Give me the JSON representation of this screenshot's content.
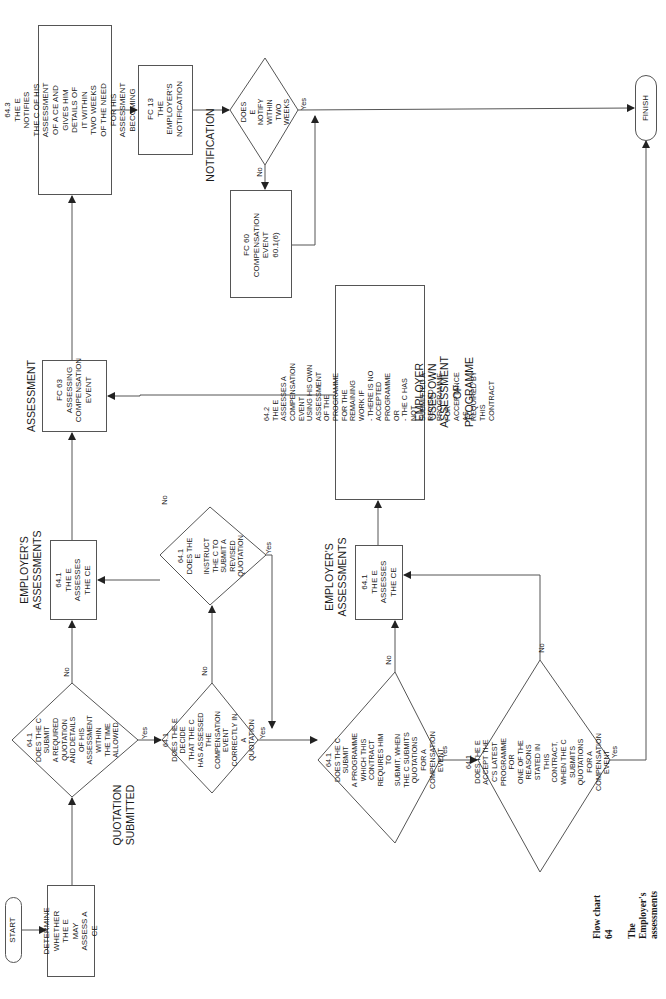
{
  "orientation": "page rotated 90 degrees counter-clockwise",
  "caption": {
    "line1": "Flow chart 64",
    "line2": "The Employer's assessments"
  },
  "terminals": {
    "start": "START",
    "finish": "FINISH"
  },
  "section_labels": {
    "quotation_submitted": "QUOTATION\nSUBMITTED",
    "employers_assessments_top": "EMPLOYER'S\nASSESSMENTS",
    "employers_assessments_bottom": "EMPLOYER'S\nASSESSMENTS",
    "assessment": "ASSESSMENT",
    "notification": "NOTIFICATION",
    "employer_uses_own": "EMPLOYER USES OWN\nASSESSMENT OF PROGRAMME"
  },
  "process_boxes": {
    "determine": "DETERMINE\nWHETHER THE E\nMAY ASSESS A CE",
    "assess_ce_top": "64.1\nTHE E ASSESSES\nTHE CE",
    "assess_ce_bottom": "64.1\nTHE E ASSESSES\nTHE CE",
    "notify_64_3": "64.3\nTHE E NOTIFIES THE C OF HIS\nASSESSMENT OF A CE AND GIVES HIM\nDETAILS OF IT WITHIN TWO WEEKS\nOF THE NEED FOR HIS ASSESSMENT\nBECOMING APPARENT",
    "own_assessment_64_2": "64.2\nTHE E ASSESSES A COMPENSATION EVENT\nUSING HIS OWN ASSESSMENT OF THE\nPROGRAMME FOR THE REMAINING WORK IF\n- THERE IS NO ACCEPTED PROGRAMME OR\n- THE C HAS NOT SUBMITTED A REVISED\n  PROGRAMME FOR ACCEPTANCE AS\n  REQUIRED BY THIS CONTRACT"
  },
  "subprocess_boxes": {
    "fc63": "FC 63\nASSESSING\nCOMPENSATION\nEVENT",
    "fc13": "FC 13\nTHE\nEMPLOYER'S\nNOTIFICATION",
    "fc60": "FC 60\nCOMPENSATION\nEVENT\n60.1(6)"
  },
  "decisions": {
    "submit_quotation": "64.1\nDOES THE C SUBMIT\nA REQUIRED QUOTATION\nAND DETAILS OF HIS\nASSESSMENT WITHIN\nTHE TIME ALLOWED",
    "assessed_correctly": "64.1\nDOES THE E DECIDE\nTHAT THE C HAS ASSESSED\nTHE COMPENSATION EVENT\nCORRECTLY IN A\nQUOTATION",
    "instruct_revised": "64.1\nDOES THE E\nINSTRUCT THE C TO\nSUBMIT A REVISED\nQUOTATION",
    "notify_two_weeks": "DOES\nE NOTIFY WITHIN\nTWO WEEKS",
    "submit_programme": "64.1\nDOES THE C SUBMIT\nA PROGRAMME WHICH THIS\nCONTRACT REQUIRES HIM TO\nSUBMIT, WHEN THE C SUBMITS\nQUOTATIONS FOR A\nCOMPENSATION\nEVENT",
    "accept_programme": "64.1\nDOES THE E ACCEPT THE\nC'S LATEST PROGRAMME FOR\nONE OF THE REASONS STATED IN\nTHIS CONTRACT, WHEN THE C\nSUBMITS QUOTATIONS FOR A\nCOMPENSATION\nEVENT"
  },
  "branch_labels": {
    "yes": "Yes",
    "no": "No"
  },
  "colors": {
    "line": "#555555",
    "text": "#1a1a1a",
    "background": "#ffffff"
  }
}
